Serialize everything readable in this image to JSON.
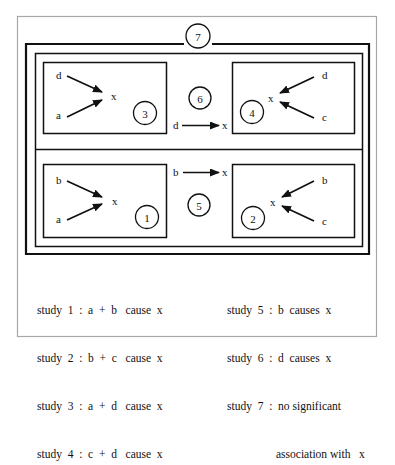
{
  "diagram": {
    "colors": {
      "line": "#111111",
      "frame": "#a8a8a8",
      "background": "#ffffff"
    },
    "outer_label": "7",
    "panels": [
      {
        "id": "3",
        "sources": [
          "d",
          "a"
        ],
        "target": "x",
        "direction": "right"
      },
      {
        "id": "4",
        "sources": [
          "d",
          "c"
        ],
        "target": "x",
        "direction": "left"
      },
      {
        "id": "1",
        "sources": [
          "b",
          "a"
        ],
        "target": "x",
        "direction": "right"
      },
      {
        "id": "2",
        "sources": [
          "b",
          "c"
        ],
        "target": "x",
        "direction": "left"
      }
    ],
    "middle": {
      "top": {
        "id": "6",
        "source": "d",
        "target": "x"
      },
      "bottom": {
        "id": "5",
        "source": "b",
        "target": "x"
      }
    }
  },
  "legend": {
    "left": [
      "study  1  :  a  +  b   cause  x",
      "study  2  :  b  +  c   cause  x",
      "study  3  :  a  +  d   cause  x",
      "study  4  :  c  +  d   cause  x"
    ],
    "right": [
      "study  5  :  b  causes  x",
      "study  6  :  d  causes  x",
      "study  7  :  no significant",
      "association with   x"
    ]
  }
}
